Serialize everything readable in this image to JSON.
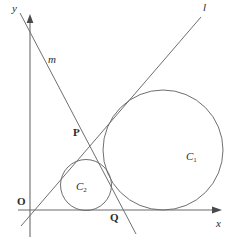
{
  "figure": {
    "type": "geometry-diagram",
    "width": 232,
    "height": 243,
    "background_color": "#ffffff",
    "stroke_color": "#555555",
    "text_color": "#2b2b2b"
  },
  "axes": {
    "origin": {
      "x": 30,
      "y": 210
    },
    "x_axis": {
      "label": "x",
      "from": {
        "x": 18,
        "y": 210
      },
      "to": {
        "x": 221,
        "y": 210
      },
      "arrow": true,
      "label_pos": {
        "x": 217,
        "y": 219
      }
    },
    "y_axis": {
      "label": "y",
      "from": {
        "x": 30,
        "y": 237
      },
      "to": {
        "x": 30,
        "y": 15
      },
      "arrow": true,
      "label_pos": {
        "x": 12,
        "y": 5
      }
    },
    "origin_label": {
      "text": "O",
      "x": 18,
      "y": 197
    }
  },
  "lines": [
    {
      "name": "l",
      "label": "l",
      "label_pos": {
        "x": 203,
        "y": 3
      },
      "from": {
        "x": 21,
        "y": 226
      },
      "to": {
        "x": 201,
        "y": 17
      }
    },
    {
      "name": "m",
      "label": "m",
      "label_pos": {
        "x": 48,
        "y": 55
      },
      "from": {
        "x": 20,
        "y": 13
      },
      "to": {
        "x": 136,
        "y": 234
      }
    }
  ],
  "circles": [
    {
      "name": "C1",
      "label": "C",
      "subscript": "1",
      "center": {
        "x": 163,
        "y": 150
      },
      "radius": 60,
      "label_pos": {
        "x": 186,
        "y": 152
      }
    },
    {
      "name": "C2",
      "label": "C",
      "subscript": "2",
      "center": {
        "x": 86,
        "y": 185
      },
      "radius": 25.5,
      "label_pos": {
        "x": 77,
        "y": 182
      }
    }
  ],
  "points": [
    {
      "name": "P",
      "label": "P",
      "x": 88,
      "y": 141,
      "label_pos": {
        "x": 74,
        "y": 128
      }
    },
    {
      "name": "Q",
      "label": "Q",
      "x": 108,
      "y": 210,
      "label_pos": {
        "x": 111,
        "y": 212
      }
    }
  ]
}
